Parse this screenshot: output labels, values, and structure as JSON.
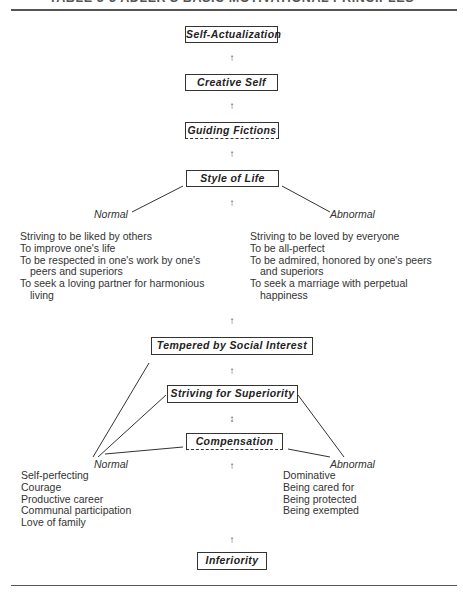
{
  "title": "TABLE 3-3 ADLER'S BASIC MOTIVATIONAL PRINCIPLES",
  "boxes": {
    "self_actualization": "Self-Actualization",
    "creative_self": "Creative Self",
    "guiding_fictions": "Guiding Fictions",
    "style_of_life": "Style of Life",
    "tempered_by_social_interest": "Tempered by Social Interest",
    "striving_for_superiority": "Striving for Superiority",
    "compensation": "Compensation",
    "inferiority": "Inferiority"
  },
  "arrows": {
    "up": "↑",
    "updown": "↕"
  },
  "style_of_life_branches": {
    "normal": {
      "label": "Normal",
      "items": [
        {
          "text": "Striving to be liked by others"
        },
        {
          "text": "To improve one's life"
        },
        {
          "text": "To be respected in one's work by one's",
          "cont": "peers and superiors"
        },
        {
          "text": "To seek a loving partner for harmonious",
          "cont": "living"
        }
      ]
    },
    "abnormal": {
      "label": "Abnormal",
      "items": [
        {
          "text": "Striving to be loved by everyone"
        },
        {
          "text": "To be all-perfect"
        },
        {
          "text": "To be admired, honored by one's peers",
          "cont": "and superiors"
        },
        {
          "text": "To seek a marriage with perpetual",
          "cont": "happiness"
        }
      ]
    }
  },
  "compensation_branches": {
    "normal": {
      "label": "Normal",
      "items": [
        "Self-perfecting",
        "Courage",
        "Productive career",
        "Communal participation",
        "Love of family"
      ]
    },
    "abnormal": {
      "label": "Abnormal",
      "items": [
        "Dominative",
        "Being cared for",
        "Being protected",
        "Being exempted"
      ]
    }
  }
}
